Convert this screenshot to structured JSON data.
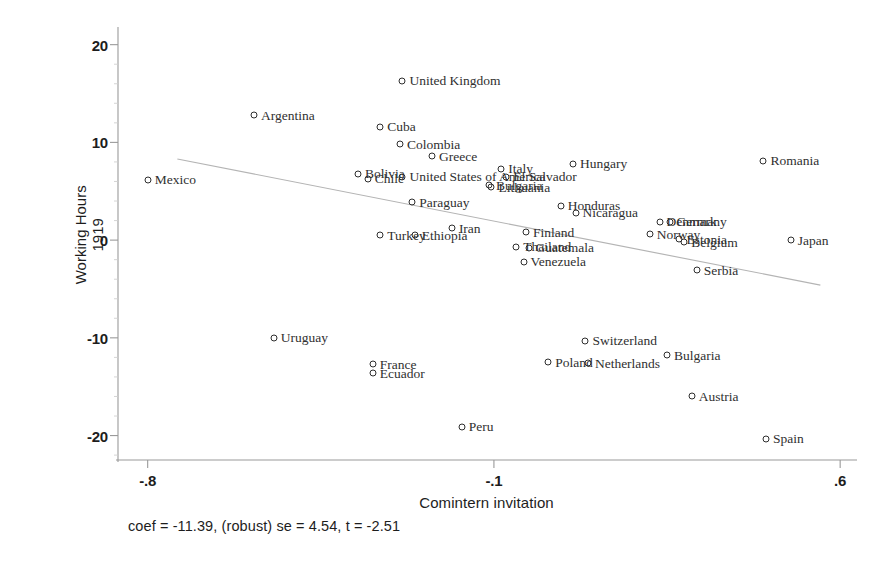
{
  "chart_data": {
    "type": "scatter",
    "title": "",
    "xlabel": "Comintern invitation",
    "ylabel": "Working Hours 1919",
    "ylabel_lines": [
      "Working Hours",
      "1919"
    ],
    "xticks": [
      "-.8",
      "-.1",
      ".6"
    ],
    "xtick_values": [
      -0.8,
      -0.1,
      0.6
    ],
    "yticks": [
      "20",
      "10",
      "0",
      "-10",
      "-20"
    ],
    "ytick_values": [
      20,
      10,
      0,
      -10,
      -20
    ],
    "xlim": [
      -0.86,
      0.63
    ],
    "ylim": [
      -22.5,
      21.5
    ],
    "grid": false,
    "legend": "none",
    "marker": "open-circle",
    "annotation": "coef = -11.39, (robust) se = 4.54, t = -2.51",
    "fit_line": {
      "type": "linear-fit",
      "slope": -11.39,
      "x_start": -0.74,
      "y_start": 8.3,
      "x_end": 0.56,
      "y_end": -4.6
    },
    "points": [
      {
        "label": "United Kingdom",
        "x": -0.285,
        "y": 16.3,
        "label_side": "right"
      },
      {
        "label": "Argentina",
        "x": -0.585,
        "y": 12.8,
        "label_side": "right"
      },
      {
        "label": "Cuba",
        "x": -0.33,
        "y": 11.6,
        "label_side": "right"
      },
      {
        "label": "Colombia",
        "x": -0.29,
        "y": 9.8,
        "label_side": "right"
      },
      {
        "label": "Greece",
        "x": -0.225,
        "y": 8.6,
        "label_side": "right"
      },
      {
        "label": "Hungary",
        "x": 0.06,
        "y": 7.8,
        "label_side": "right"
      },
      {
        "label": "Romania",
        "x": 0.445,
        "y": 8.1,
        "label_side": "right"
      },
      {
        "label": "Bolivia",
        "x": -0.375,
        "y": 6.8,
        "label_side": "right"
      },
      {
        "label": "Chile",
        "x": -0.355,
        "y": 6.3,
        "label_side": "right"
      },
      {
        "label": "Mexico",
        "x": -0.8,
        "y": 6.2,
        "label_side": "right"
      },
      {
        "label": "United States of America",
        "x": -0.285,
        "y": 6.5,
        "label_side": "right"
      },
      {
        "label": "Italy",
        "x": -0.085,
        "y": 7.3,
        "label_side": "right"
      },
      {
        "label": "El Salvador",
        "x": -0.075,
        "y": 6.5,
        "label_side": "right"
      },
      {
        "label": "Bulgaria",
        "x": -0.11,
        "y": 5.6,
        "label_side": "right"
      },
      {
        "label": "Lithuania",
        "x": -0.105,
        "y": 5.4,
        "label_side": "right"
      },
      {
        "label": "Paraguay",
        "x": -0.265,
        "y": 3.9,
        "label_side": "right"
      },
      {
        "label": "Honduras",
        "x": 0.035,
        "y": 3.5,
        "label_side": "right"
      },
      {
        "label": "Nicaragua",
        "x": 0.065,
        "y": 2.8,
        "label_side": "right"
      },
      {
        "label": "Denmark",
        "x": 0.235,
        "y": 1.9,
        "label_side": "right"
      },
      {
        "label": "Germany",
        "x": 0.255,
        "y": 1.9,
        "label_side": "right"
      },
      {
        "label": "Turkey",
        "x": -0.33,
        "y": 0.5,
        "label_side": "right"
      },
      {
        "label": "Ethiopia",
        "x": -0.26,
        "y": 0.5,
        "label_side": "right"
      },
      {
        "label": "Iran",
        "x": -0.185,
        "y": 1.2,
        "label_side": "right"
      },
      {
        "label": "Finland",
        "x": -0.035,
        "y": 0.8,
        "label_side": "right"
      },
      {
        "label": "Norway",
        "x": 0.215,
        "y": 0.6,
        "label_side": "right"
      },
      {
        "label": "Estonia",
        "x": 0.275,
        "y": 0.1,
        "label_side": "right"
      },
      {
        "label": "Belgium",
        "x": 0.285,
        "y": -0.2,
        "label_side": "right"
      },
      {
        "label": "Japan",
        "x": 0.5,
        "y": 0.0,
        "label_side": "right"
      },
      {
        "label": "Thailand",
        "x": -0.055,
        "y": -0.7,
        "label_side": "right"
      },
      {
        "label": "Guatemala",
        "x": -0.03,
        "y": -0.8,
        "label_side": "right"
      },
      {
        "label": "Venezuela",
        "x": -0.04,
        "y": -2.2,
        "label_side": "right"
      },
      {
        "label": "Serbia",
        "x": 0.31,
        "y": -3.1,
        "label_side": "right"
      },
      {
        "label": "Uruguay",
        "x": -0.545,
        "y": -10.0,
        "label_side": "right"
      },
      {
        "label": "Switzerland",
        "x": 0.085,
        "y": -10.3,
        "label_side": "right"
      },
      {
        "label": "Bulgaria ",
        "x": 0.25,
        "y": -11.8,
        "label_side": "right"
      },
      {
        "label": "Poland",
        "x": 0.01,
        "y": -12.5,
        "label_side": "right"
      },
      {
        "label": "Netherlands",
        "x": 0.09,
        "y": -12.6,
        "label_side": "right"
      },
      {
        "label": "France",
        "x": -0.345,
        "y": -12.7,
        "label_side": "right"
      },
      {
        "label": "Ecuador",
        "x": -0.345,
        "y": -13.6,
        "label_side": "right"
      },
      {
        "label": "Austria",
        "x": 0.3,
        "y": -16.0,
        "label_side": "right"
      },
      {
        "label": "Peru",
        "x": -0.165,
        "y": -19.1,
        "label_side": "right"
      },
      {
        "label": "Spain",
        "x": 0.45,
        "y": -20.3,
        "label_side": "right"
      }
    ]
  },
  "colors": {
    "marker_stroke": "#2e2e2e",
    "label_text": "#303030",
    "axis": "#9a9a9a",
    "fit_line": "#b4b4b4",
    "tick_text": "#1d1d1d"
  }
}
